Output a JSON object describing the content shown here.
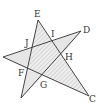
{
  "diagram": {
    "type": "geometry-star-figure",
    "labels": {
      "E": "E",
      "D": "D",
      "C": "C",
      "I": "I",
      "J": "J",
      "H": "H",
      "F": "F",
      "G": "G"
    },
    "points": {
      "E": [
        38,
        20
      ],
      "D": [
        81,
        31
      ],
      "C": [
        89,
        96
      ],
      "L": [
        3,
        57
      ],
      "B": [
        21,
        98
      ],
      "J": [
        31,
        48
      ],
      "I": [
        52,
        41
      ],
      "H": [
        62,
        55
      ],
      "G": [
        43,
        76
      ],
      "F": [
        27,
        69
      ]
    },
    "colors": {
      "line": "#333333",
      "fill": "#e6e6e6",
      "hatch": "#bdbdbd"
    }
  }
}
